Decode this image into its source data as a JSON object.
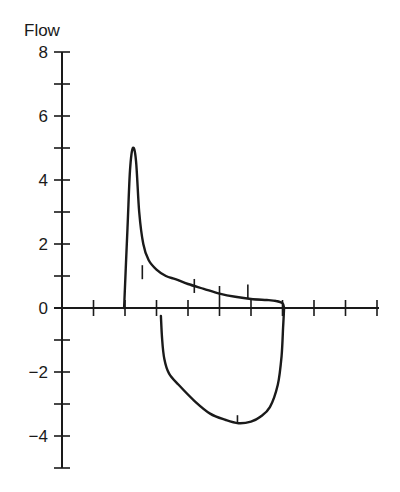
{
  "chart_data": {
    "type": "line",
    "title": "",
    "xlabel": "",
    "ylabel": "Flow",
    "ylim": [
      -5,
      8
    ],
    "xlim": [
      0,
      10
    ],
    "grid": false,
    "legend": null,
    "y_ticks_labeled": [
      8,
      6,
      4,
      2,
      0,
      -2,
      -4
    ],
    "y_tick_labels": [
      "8",
      "6",
      "4",
      "2",
      "0",
      "−2",
      "−4"
    ],
    "y_ticks_minor": [
      7,
      5,
      3,
      1,
      -1,
      -3,
      -5
    ],
    "x_ticks": [
      1,
      2,
      3,
      4,
      5,
      6,
      7,
      8,
      9,
      10
    ],
    "x_tick_labels": [],
    "series": [
      {
        "name": "expiratory flow",
        "points": [
          [
            1.97,
            0
          ],
          [
            2.08,
            2.5
          ],
          [
            2.16,
            4.3
          ],
          [
            2.25,
            5.0
          ],
          [
            2.35,
            4.6
          ],
          [
            2.45,
            3.0
          ],
          [
            2.58,
            2.0
          ],
          [
            2.75,
            1.5
          ],
          [
            3.0,
            1.2
          ],
          [
            3.3,
            1.0
          ],
          [
            3.6,
            0.9
          ],
          [
            4.0,
            0.75
          ],
          [
            4.5,
            0.6
          ],
          [
            5.0,
            0.45
          ],
          [
            5.5,
            0.35
          ],
          [
            6.0,
            0.28
          ],
          [
            6.5,
            0.25
          ],
          [
            6.8,
            0.22
          ],
          [
            7.0,
            0.15
          ],
          [
            7.05,
            0
          ]
        ]
      },
      {
        "name": "inspiratory flow",
        "points": [
          [
            3.14,
            -0.25
          ],
          [
            3.18,
            -1.0
          ],
          [
            3.25,
            -1.6
          ],
          [
            3.4,
            -2.05
          ],
          [
            3.7,
            -2.4
          ],
          [
            4.2,
            -2.9
          ],
          [
            4.7,
            -3.3
          ],
          [
            5.2,
            -3.5
          ],
          [
            5.6,
            -3.6
          ],
          [
            6.0,
            -3.55
          ],
          [
            6.3,
            -3.4
          ],
          [
            6.6,
            -3.1
          ],
          [
            6.85,
            -2.4
          ],
          [
            6.97,
            -1.5
          ],
          [
            7.02,
            -0.6
          ],
          [
            7.05,
            0
          ]
        ]
      }
    ]
  }
}
